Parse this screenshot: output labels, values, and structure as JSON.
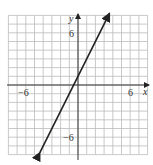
{
  "chart_data": {
    "type": "line",
    "title": "",
    "xlabel": "x",
    "ylabel": "y",
    "xlim": [
      -8,
      8
    ],
    "ylim": [
      -8,
      8
    ],
    "grid": true,
    "x_ticks_labeled": [
      -6,
      6
    ],
    "y_ticks_labeled": [
      6,
      -6
    ],
    "series": [
      {
        "name": "y = 2x + 1",
        "equation": "y = 2x + 1",
        "slope": 2,
        "intercept": 1,
        "x": [
          -4.4,
          3.6
        ],
        "y": [
          -7.8,
          8.2
        ],
        "arrows": "both"
      }
    ]
  },
  "labels": {
    "x_axis": "x",
    "y_axis": "y",
    "x_neg": "−6",
    "x_pos": "6",
    "y_pos": "6",
    "y_neg": "−6"
  }
}
